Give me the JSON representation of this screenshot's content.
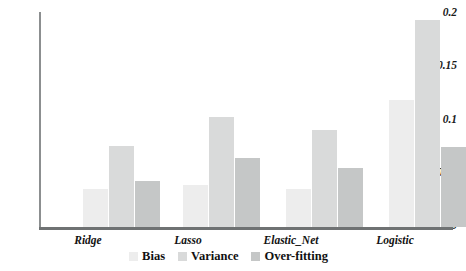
{
  "chart_data": {
    "type": "bar",
    "title": "",
    "xlabel": "",
    "ylabel": "",
    "categories": [
      "Ridge",
      "Lasso",
      "Elastic_Net",
      "Logistic"
    ],
    "series": [
      {
        "name": "Bias",
        "color": "#ededed",
        "values": [
          0.035,
          0.039,
          0.035,
          0.118
        ]
      },
      {
        "name": "Variance",
        "color": "#d9dada",
        "values": [
          0.075,
          0.102,
          0.09,
          0.193
        ]
      },
      {
        "name": "Over-fitting",
        "color": "#c5c7c7",
        "values": [
          0.043,
          0.064,
          0.055,
          0.074
        ]
      }
    ],
    "ylim": [
      0,
      0.2
    ],
    "yticks": [
      0,
      0.05,
      0.1,
      0.15,
      0.2
    ],
    "ytick_labels": [
      "0",
      "0.05",
      "0.1",
      "0.15",
      "0.2"
    ],
    "grid": false,
    "legend_position": "bottom"
  },
  "axis": {
    "y_labels": [
      "0.2",
      "0.15",
      "0.1",
      "0.05",
      "0"
    ]
  },
  "legend": {
    "items": [
      {
        "label": "Bias",
        "color": "#ededed"
      },
      {
        "label": "Variance",
        "color": "#d9dada"
      },
      {
        "label": "Over-fitting",
        "color": "#c5c7c7"
      }
    ]
  }
}
